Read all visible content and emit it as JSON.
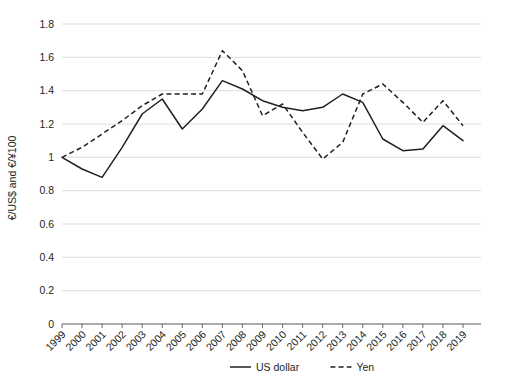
{
  "chart_data": {
    "type": "line",
    "title": "",
    "xlabel": "",
    "ylabel": "€/US$ and €/¥100",
    "ylim": [
      0,
      1.8
    ],
    "ytick_step": 0.2,
    "grid": true,
    "legend_position": "bottom-right",
    "x": [
      1999,
      2000,
      2001,
      2002,
      2003,
      2004,
      2005,
      2006,
      2007,
      2008,
      2009,
      2010,
      2011,
      2012,
      2013,
      2014,
      2015,
      2016,
      2017,
      2018,
      2019
    ],
    "categories": [
      "1999",
      "2000",
      "2001",
      "2002",
      "2003",
      "2004",
      "2005",
      "2006",
      "2007",
      "2008",
      "2009",
      "2010",
      "2011",
      "2012",
      "2013",
      "2014",
      "2015",
      "2016",
      "2017",
      "2018",
      "2019"
    ],
    "ytick_labels": [
      "0",
      "0.2",
      "0.4",
      "0.6",
      "0.8",
      "1",
      "1.2",
      "1.4",
      "1.6",
      "1.8"
    ],
    "ytick_values": [
      0,
      0.2,
      0.4,
      0.6,
      0.8,
      1,
      1.2,
      1.4,
      1.6,
      1.8
    ],
    "series": [
      {
        "name": "US dollar",
        "style": "solid",
        "color": "#231f20",
        "values": [
          1.0,
          0.93,
          0.88,
          1.06,
          1.26,
          1.35,
          1.17,
          1.29,
          1.46,
          1.41,
          1.34,
          1.3,
          1.28,
          1.3,
          1.38,
          1.33,
          1.11,
          1.04,
          1.05,
          1.19,
          1.1
        ]
      },
      {
        "name": "Yen",
        "style": "dashed",
        "color": "#231f20",
        "values": [
          1.0,
          1.06,
          1.14,
          1.22,
          1.31,
          1.38,
          1.38,
          1.38,
          1.64,
          1.52,
          1.25,
          1.32,
          1.15,
          0.99,
          1.09,
          1.38,
          1.44,
          1.33,
          1.21,
          1.34,
          1.19
        ]
      }
    ]
  },
  "legend": {
    "items": [
      {
        "label": "US dollar",
        "style": "solid"
      },
      {
        "label": "Yen",
        "style": "dashed"
      }
    ]
  }
}
